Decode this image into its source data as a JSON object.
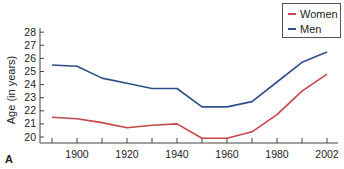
{
  "chart_data": {
    "type": "line",
    "title": "",
    "xlabel": "",
    "ylabel": "Age (in years)",
    "panel_label": "A",
    "x": [
      1890,
      1900,
      1910,
      1920,
      1930,
      1940,
      1950,
      1960,
      1970,
      1980,
      1990,
      2002
    ],
    "x_ticks": [
      1890,
      1900,
      1910,
      1920,
      1930,
      1940,
      1950,
      1960,
      1970,
      1980,
      1990,
      2000
    ],
    "x_tick_labels": [
      "1900",
      "1920",
      "1940",
      "1960",
      "1980",
      "2002"
    ],
    "x_tick_label_positions": [
      1900,
      1920,
      1940,
      1960,
      1980,
      2000
    ],
    "y_ticks": [
      20,
      21,
      22,
      23,
      24,
      25,
      26,
      27,
      28
    ],
    "ylim": [
      19.5,
      28.3
    ],
    "xlim": [
      1885,
      2005
    ],
    "grid": false,
    "legend_position": "top-right",
    "series": [
      {
        "name": "Women",
        "color": "#c8454a",
        "values": [
          21.5,
          21.4,
          21.1,
          20.7,
          20.9,
          21.0,
          19.9,
          19.9,
          20.4,
          21.7,
          23.5,
          24.8
        ]
      },
      {
        "name": "Men",
        "color": "#2e4f8c",
        "values": [
          25.5,
          25.4,
          24.5,
          24.1,
          23.7,
          23.7,
          22.3,
          22.3,
          22.7,
          24.2,
          25.7,
          26.5
        ]
      }
    ]
  },
  "legend": {
    "items": [
      {
        "label": "Women",
        "color": "#c8454a"
      },
      {
        "label": "Men",
        "color": "#2e4f8c"
      }
    ]
  }
}
